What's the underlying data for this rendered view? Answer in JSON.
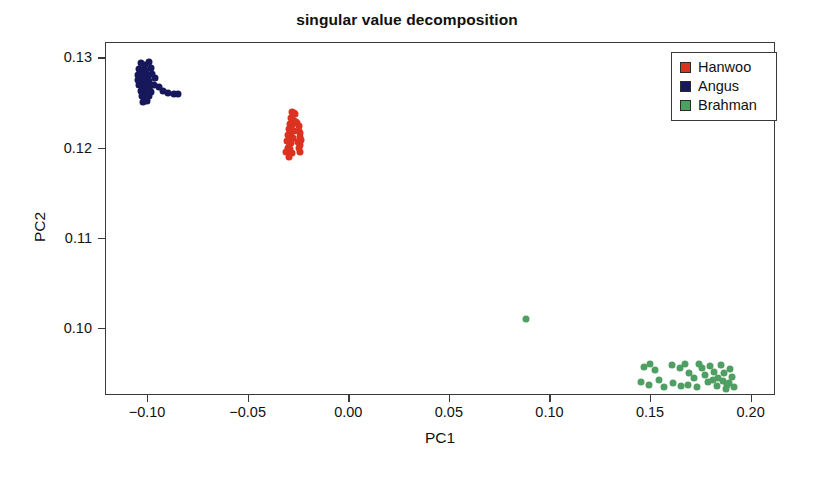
{
  "chart_data": {
    "type": "scatter",
    "title": "singular value decomposition",
    "xlabel": "PC1",
    "ylabel": "PC2",
    "xlim": [
      -0.1209,
      0.2121
    ],
    "ylim": [
      0.0926,
      0.1317
    ],
    "xticks": [
      -0.1,
      -0.05,
      0.0,
      0.05,
      0.1,
      0.15,
      0.2
    ],
    "xticklabels": [
      "−0.10",
      "−0.05",
      "0.00",
      "0.05",
      "0.10",
      "0.15",
      "0.20"
    ],
    "yticks": [
      0.1,
      0.11,
      0.12,
      0.13
    ],
    "yticklabels": [
      "0.10",
      "0.11",
      "0.12",
      "0.13"
    ],
    "grid": false,
    "legend_position": "top-right",
    "marker": "filled-circle",
    "marker_size_px": 7,
    "series": [
      {
        "name": "Hanwoo",
        "color": "#dc3220",
        "points": [
          [
            -0.0283,
            0.1241
          ],
          [
            -0.0277,
            0.124
          ],
          [
            -0.0272,
            0.1238
          ],
          [
            -0.0288,
            0.1234
          ],
          [
            -0.028,
            0.1232
          ],
          [
            -0.0273,
            0.1231
          ],
          [
            -0.0266,
            0.1229
          ],
          [
            -0.0295,
            0.1227
          ],
          [
            -0.0286,
            0.1226
          ],
          [
            -0.0258,
            0.1228
          ],
          [
            -0.025,
            0.1225
          ],
          [
            -0.0301,
            0.1222
          ],
          [
            -0.0292,
            0.1221
          ],
          [
            -0.0283,
            0.122
          ],
          [
            -0.0275,
            0.1219
          ],
          [
            -0.0252,
            0.122
          ],
          [
            -0.0244,
            0.1217
          ],
          [
            -0.0305,
            0.1215
          ],
          [
            -0.0296,
            0.1214
          ],
          [
            -0.0288,
            0.1213
          ],
          [
            -0.0279,
            0.1212
          ],
          [
            -0.0247,
            0.1213
          ],
          [
            -0.0239,
            0.121
          ],
          [
            -0.0309,
            0.1208
          ],
          [
            -0.0299,
            0.1207
          ],
          [
            -0.029,
            0.1206
          ],
          [
            -0.0257,
            0.1207
          ],
          [
            -0.0243,
            0.1204
          ],
          [
            -0.0303,
            0.1201
          ],
          [
            -0.0294,
            0.12
          ],
          [
            -0.0251,
            0.1201
          ],
          [
            -0.0312,
            0.1196
          ],
          [
            -0.0285,
            0.1195
          ],
          [
            -0.0246,
            0.1196
          ],
          [
            -0.0299,
            0.1191
          ]
        ]
      },
      {
        "name": "Angus",
        "color": "#17175c",
        "points": [
          [
            -0.1036,
            0.1295
          ],
          [
            -0.1017,
            0.1293
          ],
          [
            -0.0993,
            0.1296
          ],
          [
            -0.1045,
            0.1288
          ],
          [
            -0.1028,
            0.1287
          ],
          [
            -0.101,
            0.1286
          ],
          [
            -0.0986,
            0.1289
          ],
          [
            -0.1052,
            0.1282
          ],
          [
            -0.1035,
            0.1281
          ],
          [
            -0.1019,
            0.128
          ],
          [
            -0.1001,
            0.1281
          ],
          [
            -0.0978,
            0.1283
          ],
          [
            -0.1049,
            0.1276
          ],
          [
            -0.1032,
            0.1275
          ],
          [
            -0.1014,
            0.1274
          ],
          [
            -0.0996,
            0.1275
          ],
          [
            -0.0964,
            0.1278
          ],
          [
            -0.1043,
            0.127
          ],
          [
            -0.1026,
            0.1269
          ],
          [
            -0.1008,
            0.1268
          ],
          [
            -0.099,
            0.1269
          ],
          [
            -0.0972,
            0.1271
          ],
          [
            -0.1037,
            0.1264
          ],
          [
            -0.102,
            0.1263
          ],
          [
            -0.1002,
            0.1262
          ],
          [
            -0.0984,
            0.1263
          ],
          [
            -0.0948,
            0.1268
          ],
          [
            -0.1031,
            0.1258
          ],
          [
            -0.1013,
            0.1257
          ],
          [
            -0.0995,
            0.1258
          ],
          [
            -0.0926,
            0.1264
          ],
          [
            -0.1024,
            0.1252
          ],
          [
            -0.1006,
            0.1253
          ],
          [
            -0.0903,
            0.1262
          ],
          [
            -0.0871,
            0.1261
          ],
          [
            -0.0852,
            0.1261
          ]
        ]
      },
      {
        "name": "Brahman",
        "color": "#4f9e62",
        "points": [
          [
            0.0879,
            0.1011
          ],
          [
            0.1464,
            0.0958
          ],
          [
            0.1497,
            0.0962
          ],
          [
            0.1521,
            0.0955
          ],
          [
            0.1452,
            0.0941
          ],
          [
            0.1489,
            0.0938
          ],
          [
            0.154,
            0.0944
          ],
          [
            0.1605,
            0.096
          ],
          [
            0.1643,
            0.0957
          ],
          [
            0.1607,
            0.094
          ],
          [
            0.1649,
            0.0937
          ],
          [
            0.169,
            0.0952
          ],
          [
            0.1714,
            0.0946
          ],
          [
            0.1684,
            0.0938
          ],
          [
            0.1729,
            0.0936
          ],
          [
            0.1752,
            0.0957
          ],
          [
            0.1768,
            0.0949
          ],
          [
            0.1781,
            0.0941
          ],
          [
            0.1795,
            0.0959
          ],
          [
            0.1812,
            0.0953
          ],
          [
            0.1806,
            0.0944
          ],
          [
            0.1826,
            0.0937
          ],
          [
            0.1848,
            0.096
          ],
          [
            0.1861,
            0.0951
          ],
          [
            0.1857,
            0.0943
          ],
          [
            0.1879,
            0.0938
          ],
          [
            0.1894,
            0.0956
          ],
          [
            0.1901,
            0.0947
          ],
          [
            0.1888,
            0.094
          ],
          [
            0.1914,
            0.0936
          ],
          [
            0.1565,
            0.0936
          ],
          [
            0.1667,
            0.0961
          ],
          [
            0.174,
            0.0962
          ],
          [
            0.1835,
            0.0946
          ],
          [
            0.187,
            0.0934
          ]
        ]
      }
    ]
  },
  "legend": {
    "items": [
      {
        "label": "Hanwoo",
        "color": "#dc3220"
      },
      {
        "label": "Angus",
        "color": "#17175c"
      },
      {
        "label": "Brahman",
        "color": "#4f9e62"
      }
    ]
  }
}
